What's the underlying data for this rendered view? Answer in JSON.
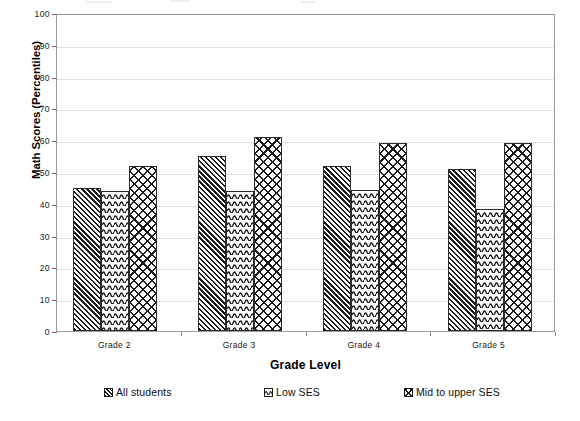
{
  "chart_data": {
    "type": "bar",
    "title": "",
    "xlabel": "Grade Level",
    "ylabel": "Math Scores (Percentiles)",
    "categories": [
      "Grade 2",
      "Grade 3",
      "Grade 4",
      "Grade 5"
    ],
    "series": [
      {
        "name": "All  students",
        "pattern": "diagonal-hatch",
        "values": [
          45,
          55,
          52,
          51
        ]
      },
      {
        "name": "Low SES",
        "pattern": "wavy-lines",
        "values": [
          44,
          44,
          44.5,
          38.5
        ]
      },
      {
        "name": "Mid to upper SES",
        "pattern": "cross-hatch",
        "values": [
          52,
          61,
          59,
          59
        ]
      }
    ],
    "ylim": [
      0,
      100
    ],
    "yticks": [
      0,
      10,
      20,
      30,
      40,
      50,
      60,
      70,
      80,
      90,
      100
    ],
    "ytick_labels": [
      "0",
      "10",
      "20",
      "30",
      "40",
      "50",
      "60",
      "70",
      "80",
      "90",
      "100"
    ],
    "grid": true,
    "grid_axis": "y",
    "legend_position": "bottom",
    "colors": {
      "bar_edge": "#2b2b2b",
      "bar_fill": "#ffffff",
      "pattern_ink": "#1c1c1c",
      "gridline": "#c9c9c9",
      "axis": "#9a9a9a",
      "text": "#000000"
    }
  }
}
